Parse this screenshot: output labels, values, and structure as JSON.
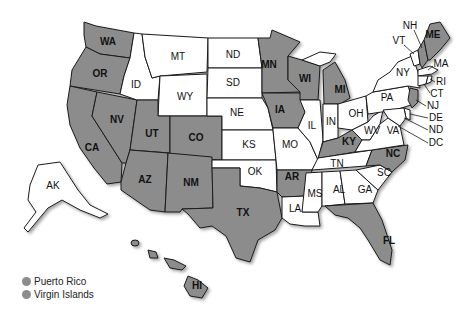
{
  "map": {
    "colors": {
      "highlighted": "#8c8c8c",
      "unhighlighted": "#ffffff",
      "border": "#1a1a1a"
    },
    "states": [
      {
        "code": "WA",
        "highlighted": true
      },
      {
        "code": "OR",
        "highlighted": true
      },
      {
        "code": "CA",
        "highlighted": true
      },
      {
        "code": "NV",
        "highlighted": true
      },
      {
        "code": "ID",
        "highlighted": false
      },
      {
        "code": "MT",
        "highlighted": false
      },
      {
        "code": "WY",
        "highlighted": false
      },
      {
        "code": "UT",
        "highlighted": true
      },
      {
        "code": "AZ",
        "highlighted": true
      },
      {
        "code": "CO",
        "highlighted": true
      },
      {
        "code": "NM",
        "highlighted": true
      },
      {
        "code": "ND",
        "highlighted": false
      },
      {
        "code": "SD",
        "highlighted": false
      },
      {
        "code": "NE",
        "highlighted": false
      },
      {
        "code": "KS",
        "highlighted": false
      },
      {
        "code": "OK",
        "highlighted": false
      },
      {
        "code": "TX",
        "highlighted": true
      },
      {
        "code": "MN",
        "highlighted": true
      },
      {
        "code": "IA",
        "highlighted": true
      },
      {
        "code": "MO",
        "highlighted": false
      },
      {
        "code": "AR",
        "highlighted": true
      },
      {
        "code": "LA",
        "highlighted": false
      },
      {
        "code": "WI",
        "highlighted": true
      },
      {
        "code": "IL",
        "highlighted": false
      },
      {
        "code": "MS",
        "highlighted": false
      },
      {
        "code": "MI",
        "highlighted": true
      },
      {
        "code": "IN",
        "highlighted": false
      },
      {
        "code": "KY",
        "highlighted": true
      },
      {
        "code": "TN",
        "highlighted": false
      },
      {
        "code": "AL",
        "highlighted": false
      },
      {
        "code": "OH",
        "highlighted": false
      },
      {
        "code": "GA",
        "highlighted": false
      },
      {
        "code": "FL",
        "highlighted": true
      },
      {
        "code": "SC",
        "highlighted": false
      },
      {
        "code": "NC",
        "highlighted": true
      },
      {
        "code": "WV",
        "highlighted": false
      },
      {
        "code": "VA",
        "highlighted": false
      },
      {
        "code": "PA",
        "highlighted": false
      },
      {
        "code": "NY",
        "highlighted": false
      },
      {
        "code": "VT",
        "highlighted": false
      },
      {
        "code": "NH",
        "highlighted": true
      },
      {
        "code": "ME",
        "highlighted": true
      },
      {
        "code": "MA",
        "highlighted": false
      },
      {
        "code": "RI",
        "highlighted": false
      },
      {
        "code": "CT",
        "highlighted": false
      },
      {
        "code": "NJ",
        "highlighted": true
      },
      {
        "code": "DE",
        "highlighted": false
      },
      {
        "code": "ND_east",
        "label": "ND",
        "highlighted": false
      },
      {
        "code": "DC",
        "highlighted": false
      },
      {
        "code": "AK",
        "highlighted": false
      },
      {
        "code": "HI",
        "highlighted": true
      }
    ],
    "labels": {
      "WA": "WA",
      "OR": "OR",
      "CA": "CA",
      "NV": "NV",
      "ID": "ID",
      "MT": "MT",
      "WY": "WY",
      "UT": "UT",
      "AZ": "AZ",
      "CO": "CO",
      "NM": "NM",
      "ND": "ND",
      "SD": "SD",
      "NE": "NE",
      "KS": "KS",
      "OK": "OK",
      "TX": "TX",
      "MN": "MN",
      "IA": "IA",
      "MO": "MO",
      "AR": "AR",
      "LA": "LA",
      "WI": "WI",
      "IL": "IL",
      "MS": "MS",
      "MI": "MI",
      "IN": "IN",
      "KY": "KY",
      "TN": "TN",
      "AL": "AL",
      "OH": "OH",
      "GA": "GA",
      "FL": "FL",
      "SC": "SC",
      "NC": "NC",
      "WV": "WV",
      "VA": "VA",
      "PA": "PA",
      "NY": "NY",
      "VT": "VT",
      "NH": "NH",
      "ME": "ME",
      "MA": "MA",
      "RI": "RI",
      "CT": "CT",
      "NJ": "NJ",
      "DE": "DE",
      "ND_east": "ND",
      "DC": "DC",
      "AK": "AK",
      "HI": "HI"
    }
  },
  "legend": {
    "items": [
      {
        "label": "Puerto Rico",
        "color": "#8c8c8c"
      },
      {
        "label": "Virgin Islands",
        "color": "#8c8c8c"
      }
    ]
  }
}
